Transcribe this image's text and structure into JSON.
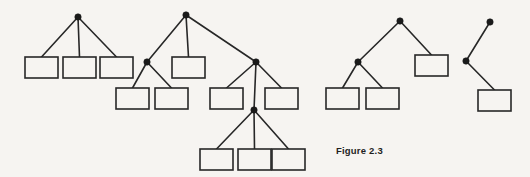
{
  "figure": {
    "caption": "Figure 2.3",
    "caption_x": 336,
    "caption_y": 145,
    "background_color": "#f6f4f1",
    "stroke_color": "#272727",
    "node_fill_color": "#1a1a1a",
    "box_fill_color": "#f6f4f1",
    "canvas": {
      "width": 530,
      "height": 177
    }
  },
  "diagram_data": {
    "type": "diagram",
    "description": "Four rooted ordered trees drawn left to right; internal vertices are filled dots, leaves are open rectangles",
    "style": {
      "edge_width": 1.6,
      "box_border_width": 1.6,
      "node_radius": 3.2,
      "box_width": 33,
      "box_height": 21
    },
    "trees": [
      {
        "name": "tree-1",
        "root": {
          "id": "t1-root",
          "x": 78,
          "y": 17
        },
        "nodes": [
          {
            "id": "t1-root",
            "kind": "dot",
            "x": 78,
            "y": 17
          }
        ],
        "boxes": [
          {
            "id": "t1-b1",
            "x": 25,
            "y": 57
          },
          {
            "id": "t1-b2",
            "x": 63,
            "y": 57
          },
          {
            "id": "t1-b3",
            "x": 100,
            "y": 57
          }
        ],
        "edges": [
          {
            "from": "t1-root",
            "to": "t1-b1"
          },
          {
            "from": "t1-root",
            "to": "t1-b2"
          },
          {
            "from": "t1-root",
            "to": "t1-b3"
          }
        ]
      },
      {
        "name": "tree-2",
        "root": {
          "id": "t2-root",
          "x": 186,
          "y": 15
        },
        "nodes": [
          {
            "id": "t2-root",
            "kind": "dot",
            "x": 186,
            "y": 15
          },
          {
            "id": "t2-nL",
            "kind": "dot",
            "x": 147,
            "y": 62
          },
          {
            "id": "t2-nR",
            "kind": "dot",
            "x": 256,
            "y": 62
          },
          {
            "id": "t2-nRM",
            "kind": "dot",
            "x": 254,
            "y": 110
          }
        ],
        "boxes": [
          {
            "id": "t2-b1",
            "x": 116,
            "y": 88
          },
          {
            "id": "t2-b2",
            "x": 155,
            "y": 88
          },
          {
            "id": "t2-bMid",
            "x": 172,
            "y": 57
          },
          {
            "id": "t2-b3",
            "x": 210,
            "y": 88
          },
          {
            "id": "t2-b4",
            "x": 265,
            "y": 88
          },
          {
            "id": "t2-b5",
            "x": 200,
            "y": 149
          },
          {
            "id": "t2-b6",
            "x": 238,
            "y": 149
          },
          {
            "id": "t2-b7",
            "x": 272,
            "y": 149
          }
        ],
        "edges": [
          {
            "from": "t2-root",
            "to": "t2-nL"
          },
          {
            "from": "t2-root",
            "to": "t2-bMid"
          },
          {
            "from": "t2-root",
            "to": "t2-nR"
          },
          {
            "from": "t2-nL",
            "to": "t2-b1"
          },
          {
            "from": "t2-nL",
            "to": "t2-b2"
          },
          {
            "from": "t2-nR",
            "to": "t2-b3"
          },
          {
            "from": "t2-nR",
            "to": "t2-nRM"
          },
          {
            "from": "t2-nR",
            "to": "t2-b4"
          },
          {
            "from": "t2-nRM",
            "to": "t2-b5"
          },
          {
            "from": "t2-nRM",
            "to": "t2-b6"
          },
          {
            "from": "t2-nRM",
            "to": "t2-b7"
          }
        ]
      },
      {
        "name": "tree-3",
        "root": {
          "id": "t3-root",
          "x": 400,
          "y": 21
        },
        "nodes": [
          {
            "id": "t3-root",
            "kind": "dot",
            "x": 400,
            "y": 21
          },
          {
            "id": "t3-nL",
            "kind": "dot",
            "x": 358,
            "y": 62
          }
        ],
        "boxes": [
          {
            "id": "t3-b1",
            "x": 326,
            "y": 88
          },
          {
            "id": "t3-b2",
            "x": 366,
            "y": 88
          },
          {
            "id": "t3-bR",
            "x": 415,
            "y": 55
          }
        ],
        "edges": [
          {
            "from": "t3-root",
            "to": "t3-nL"
          },
          {
            "from": "t3-root",
            "to": "t3-bR"
          },
          {
            "from": "t3-nL",
            "to": "t3-b1"
          },
          {
            "from": "t3-nL",
            "to": "t3-b2"
          }
        ]
      },
      {
        "name": "tree-4",
        "root": {
          "id": "t4-root",
          "x": 490,
          "y": 22
        },
        "nodes": [
          {
            "id": "t4-root",
            "kind": "dot",
            "x": 490,
            "y": 22
          },
          {
            "id": "t4-n1",
            "kind": "dot",
            "x": 466,
            "y": 61
          }
        ],
        "boxes": [
          {
            "id": "t4-b1",
            "x": 478,
            "y": 90
          }
        ],
        "edges": [
          {
            "from": "t4-root",
            "to": "t4-n1"
          },
          {
            "from": "t4-n1",
            "to": "t4-b1"
          }
        ]
      }
    ]
  }
}
